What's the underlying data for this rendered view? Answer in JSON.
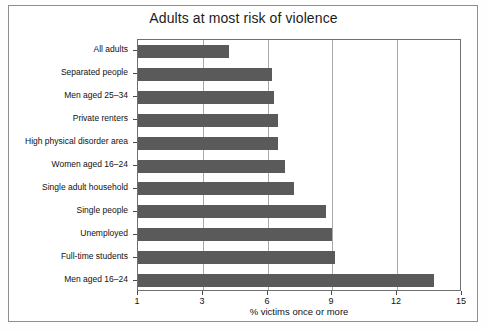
{
  "chart_data": {
    "type": "bar",
    "orientation": "horizontal",
    "title": "Adults at most risk of violence",
    "xlabel": "% victims once or more",
    "ylabel": "",
    "xlim": [
      1,
      15
    ],
    "xticks": [
      1,
      3,
      6,
      9,
      12,
      15
    ],
    "xtick_labels": [
      "1",
      "3",
      "6",
      "9",
      "12",
      "15"
    ],
    "grid": true,
    "grid_axis": "x",
    "legend": false,
    "bar_color": "#5a5a5a",
    "categories": [
      "All adults",
      "Separated people",
      "Men aged 25–34",
      "Private renters",
      "High physical disorder area",
      "Women aged 16–24",
      "Single adult household",
      "Single people",
      "Unemployed",
      "Full-time students",
      "Men aged 16–24"
    ],
    "values": [
      4.2,
      6.2,
      6.3,
      6.5,
      6.5,
      6.8,
      7.2,
      8.7,
      9.0,
      9.1,
      13.7
    ]
  },
  "frame": {
    "border_color": "#8e8e8e",
    "plot_border_color": "#6f6f6f",
    "gridline_color": "#a9a9a9",
    "background": "#ffffff"
  }
}
